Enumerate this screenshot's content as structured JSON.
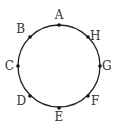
{
  "diagram": {
    "type": "circle-with-points",
    "circle": {
      "cx": 59,
      "cy": 66,
      "r": 41,
      "stroke": "#222222"
    },
    "points": [
      {
        "label": "A",
        "x": 59,
        "y": 25,
        "lx": 59,
        "ly": 19,
        "anchor": "middle"
      },
      {
        "label": "B",
        "x": 30,
        "y": 37,
        "lx": 25,
        "ly": 33,
        "anchor": "end"
      },
      {
        "label": "C",
        "x": 18,
        "y": 66,
        "lx": 14,
        "ly": 70,
        "anchor": "end"
      },
      {
        "label": "D",
        "x": 30,
        "y": 96,
        "lx": 26,
        "ly": 105,
        "anchor": "end"
      },
      {
        "label": "E",
        "x": 59,
        "y": 108,
        "lx": 59,
        "ly": 121,
        "anchor": "middle"
      },
      {
        "label": "F",
        "x": 88,
        "y": 96,
        "lx": 91,
        "ly": 105,
        "anchor": "start"
      },
      {
        "label": "G",
        "x": 100,
        "y": 66,
        "lx": 102,
        "ly": 70,
        "anchor": "start"
      },
      {
        "label": "H",
        "x": 88,
        "y": 37,
        "lx": 90,
        "ly": 40,
        "anchor": "start"
      }
    ]
  }
}
